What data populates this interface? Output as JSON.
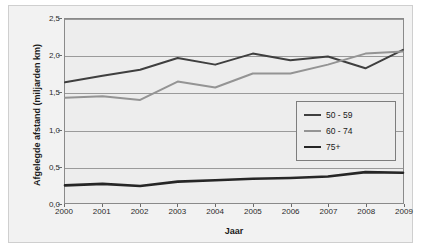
{
  "chart_data": {
    "type": "line",
    "title": "",
    "xlabel": "Jaar",
    "ylabel": "Afgelegde afstand (miljarden km)",
    "categories": [
      "2000",
      "2001",
      "2002",
      "2003",
      "2004",
      "2005",
      "2006",
      "2007",
      "2008",
      "2009"
    ],
    "x": [
      2000,
      2001,
      2002,
      2003,
      2004,
      2005,
      2006,
      2007,
      2008,
      2009
    ],
    "ylim": [
      0.0,
      2.5
    ],
    "yticks": [
      "0,0",
      "0,5",
      "1,0",
      "1,5",
      "2,0",
      "2,5"
    ],
    "ytick_values": [
      0.0,
      0.5,
      1.0,
      1.5,
      2.0,
      2.5
    ],
    "grid": true,
    "legend_position": "center-right",
    "series": [
      {
        "name": "50 - 59",
        "color": "#3f3f3f",
        "width": 2.0,
        "values": [
          1.64,
          1.73,
          1.81,
          1.97,
          1.88,
          2.03,
          1.94,
          1.99,
          1.83,
          2.08
        ]
      },
      {
        "name": "60 - 74",
        "color": "#949494",
        "width": 2.0,
        "values": [
          1.43,
          1.45,
          1.4,
          1.65,
          1.57,
          1.76,
          1.76,
          1.88,
          2.03,
          2.06
        ]
      },
      {
        "name": "75+",
        "color": "#262626",
        "width": 2.6,
        "values": [
          0.24,
          0.26,
          0.23,
          0.29,
          0.31,
          0.33,
          0.34,
          0.36,
          0.42,
          0.41
        ]
      }
    ]
  },
  "legend": {
    "items": [
      {
        "label": "50 - 59"
      },
      {
        "label": "60 - 74"
      },
      {
        "label": "75+"
      }
    ]
  }
}
